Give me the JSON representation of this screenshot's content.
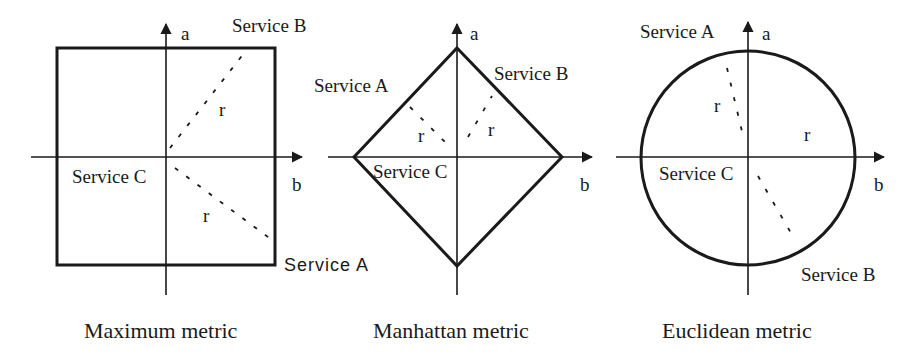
{
  "figure": {
    "panels": [
      {
        "id": "maximum",
        "caption": "Maximum metric",
        "axis_a_label": "a",
        "axis_b_label": "b",
        "shape": "square",
        "radius_labels": [
          "r",
          "r"
        ],
        "services": {
          "A": "Service A",
          "B": "Service B",
          "C": "Service C"
        }
      },
      {
        "id": "manhattan",
        "caption": "Manhattan metric",
        "axis_a_label": "a",
        "axis_b_label": "b",
        "shape": "diamond",
        "radius_labels": [
          "r",
          "r"
        ],
        "services": {
          "A": "Service A",
          "B": "Service B",
          "C": "Service C"
        }
      },
      {
        "id": "euclidean",
        "caption": "Euclidean metric",
        "axis_a_label": "a",
        "axis_b_label": "b",
        "shape": "circle",
        "radius_labels": [
          "r",
          "r"
        ],
        "services": {
          "A": "Service A",
          "B": "Service B",
          "C": "Service C"
        }
      }
    ],
    "colors": {
      "ink": "#1a1a1a",
      "background": "#ffffff"
    }
  }
}
